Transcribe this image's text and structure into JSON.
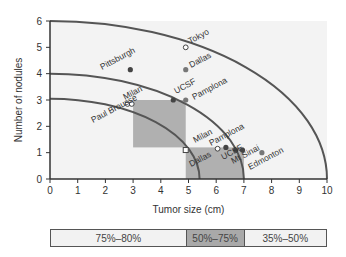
{
  "chart_data": {
    "type": "scatter",
    "title": "",
    "xlabel": "Tumor size (cm)",
    "ylabel": "Number of nodules",
    "xlim": [
      0,
      10
    ],
    "ylim": [
      0,
      6
    ],
    "xticks": [
      0,
      1,
      2,
      3,
      4,
      5,
      6,
      7,
      8,
      9,
      10
    ],
    "yticks": [
      0,
      1,
      2,
      3,
      4,
      5,
      6
    ],
    "grid": false,
    "arcs": [
      {
        "name": "outer",
        "x_radius": 10,
        "y_radius": 6
      },
      {
        "name": "middle",
        "x_radius": 7,
        "y_radius": 4
      },
      {
        "name": "inner",
        "x_radius": 5.4,
        "y_radius": 3.05
      }
    ],
    "shaded_regions": [
      {
        "x": [
          3,
          4.9
        ],
        "y": [
          1.2,
          3
        ]
      },
      {
        "x": [
          4.9,
          7
        ],
        "y": [
          0,
          1.2
        ]
      }
    ],
    "points": [
      {
        "label": "Tokyo",
        "x": 4.9,
        "y": 5.0,
        "marker": "open"
      },
      {
        "label": "Dallas",
        "x": 4.9,
        "y": 4.15,
        "marker": "gray"
      },
      {
        "label": "Pittsburgh",
        "x": 2.9,
        "y": 4.15,
        "marker": "filled"
      },
      {
        "label": "UCSF",
        "x": 4.45,
        "y": 3.0,
        "marker": "filled"
      },
      {
        "label": "Pamplona",
        "x": 4.9,
        "y": 3.0,
        "marker": "gray"
      },
      {
        "label": "Milan",
        "x": 2.8,
        "y": 2.85,
        "marker": "open"
      },
      {
        "label": "Milan",
        "x": 2.95,
        "y": 2.85,
        "marker": "open"
      },
      {
        "label": "Paul Brousse",
        "x": 3.0,
        "y": 2.8,
        "marker": "none"
      },
      {
        "label": "Milan",
        "x": 4.9,
        "y": 1.1,
        "marker": "open-square"
      },
      {
        "label": "Dallas",
        "x": 6.05,
        "y": 1.15,
        "marker": "open"
      },
      {
        "label": "Pamplona",
        "x": 6.35,
        "y": 1.2,
        "marker": "filled"
      },
      {
        "label": "UCSF",
        "x": 6.7,
        "y": 1.1,
        "marker": "filled"
      },
      {
        "label": "Mt Sinai",
        "x": 6.95,
        "y": 1.1,
        "marker": "filled"
      },
      {
        "label": "Edmonton",
        "x": 7.65,
        "y": 1.0,
        "marker": "gray"
      }
    ],
    "legend_bar": [
      {
        "label": "75%–80%",
        "x": [
          0,
          4.9
        ],
        "color": "#f2f2f2"
      },
      {
        "label": "50%–75%",
        "x": [
          4.9,
          7
        ],
        "color": "#a9a9a9"
      },
      {
        "label": "35%–50%",
        "x": [
          7,
          10
        ],
        "color": "#f2f2f2"
      }
    ]
  },
  "colors": {
    "plot_bg": "#f3f3f3",
    "shade": "#b0b0b0",
    "arc": "#555555",
    "axis": "#333333"
  }
}
